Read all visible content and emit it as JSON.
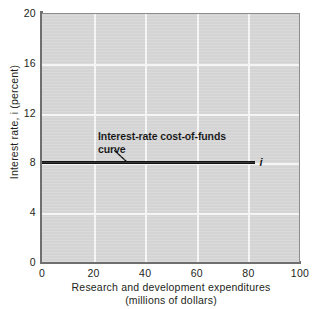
{
  "chart_data": {
    "type": "line",
    "title": "",
    "xlabel": "Research and development expenditures (millions of dollars)",
    "xlabel_line1": "Research and development expenditures",
    "xlabel_line2": "(millions of dollars)",
    "ylabel": "Interest rate, i (percent)",
    "xlim": [
      0,
      100
    ],
    "ylim": [
      0,
      20
    ],
    "xticks": [
      0,
      20,
      40,
      60,
      80,
      100
    ],
    "xtick_labels": [
      "0",
      "20",
      "40",
      "60",
      "80",
      "100"
    ],
    "yticks": [
      0,
      4,
      8,
      12,
      16,
      20
    ],
    "ytick_labels": [
      "0",
      "4",
      "8",
      "12",
      "16",
      "20"
    ],
    "grid": true,
    "grid_color": "#f4f4f4",
    "plot_background": "#d4d4d4",
    "legend_position": "none",
    "series": [
      {
        "name": "Interest-rate cost-of-funds curve",
        "symbol": "i",
        "color": "#141414",
        "x": [
          0,
          83
        ],
        "y": [
          8,
          8
        ],
        "constant_value": 8,
        "x_start": 0,
        "x_end": 83
      }
    ],
    "annotations": [
      {
        "name": "curve-annotation",
        "line1": "Interest-rate cost-of-funds",
        "line2": "curve",
        "bold": true,
        "points_to_x": 33,
        "points_to_y": 8
      },
      {
        "name": "series-end-symbol",
        "text": "i",
        "italic": true,
        "at_x": 85,
        "at_y": 8
      }
    ]
  }
}
